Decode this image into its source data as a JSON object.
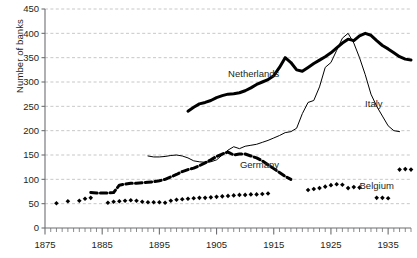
{
  "chart_data": {
    "type": "line",
    "title": "",
    "xlabel": "",
    "ylabel": "Number of banks",
    "xlim": [
      1875,
      1939
    ],
    "ylim": [
      0,
      450
    ],
    "ytick_step": 50,
    "xtick_step": 10,
    "yticks": [
      0,
      50,
      100,
      150,
      200,
      250,
      300,
      350,
      400,
      450
    ],
    "xticks": [
      1875,
      1885,
      1895,
      1905,
      1915,
      1925,
      1935
    ],
    "grid": "horizontal-dashed",
    "legend_position": "inline-annotations",
    "minor_xticks": "every 1 year",
    "series": [
      {
        "name": "Netherlands",
        "style": "thick-solid",
        "color": "#000000",
        "label_x": 1911.5,
        "label_y": 318,
        "points": [
          [
            1900,
            240
          ],
          [
            1901,
            248
          ],
          [
            1902,
            255
          ],
          [
            1903,
            258
          ],
          [
            1904,
            262
          ],
          [
            1905,
            268
          ],
          [
            1906,
            272
          ],
          [
            1907,
            275
          ],
          [
            1908,
            276
          ],
          [
            1909,
            278
          ],
          [
            1910,
            282
          ],
          [
            1911,
            288
          ],
          [
            1912,
            295
          ],
          [
            1913,
            300
          ],
          [
            1914,
            305
          ],
          [
            1915,
            313
          ],
          [
            1916,
            330
          ],
          [
            1917,
            350
          ],
          [
            1918,
            340
          ],
          [
            1919,
            325
          ],
          [
            1920,
            322
          ],
          [
            1921,
            330
          ],
          [
            1922,
            338
          ],
          [
            1923,
            345
          ],
          [
            1924,
            352
          ],
          [
            1925,
            360
          ],
          [
            1926,
            370
          ],
          [
            1927,
            380
          ],
          [
            1928,
            388
          ],
          [
            1929,
            385
          ],
          [
            1930,
            395
          ],
          [
            1931,
            400
          ],
          [
            1932,
            396
          ],
          [
            1933,
            385
          ],
          [
            1934,
            375
          ],
          [
            1935,
            368
          ],
          [
            1936,
            360
          ],
          [
            1937,
            352
          ],
          [
            1938,
            347
          ],
          [
            1939,
            345
          ]
        ]
      },
      {
        "name": "Italy",
        "style": "thin-solid",
        "color": "#000000",
        "label_x": 1932.5,
        "label_y": 255,
        "points": [
          [
            1893,
            148
          ],
          [
            1894,
            146
          ],
          [
            1895,
            146
          ],
          [
            1896,
            147
          ],
          [
            1897,
            149
          ],
          [
            1898,
            150
          ],
          [
            1899,
            148
          ],
          [
            1900,
            144
          ],
          [
            1901,
            138
          ],
          [
            1902,
            136
          ],
          [
            1903,
            135
          ],
          [
            1904,
            136
          ],
          [
            1905,
            140
          ],
          [
            1906,
            150
          ],
          [
            1907,
            160
          ],
          [
            1908,
            167
          ],
          [
            1909,
            163
          ],
          [
            1910,
            168
          ],
          [
            1911,
            170
          ],
          [
            1912,
            172
          ],
          [
            1913,
            176
          ],
          [
            1914,
            180
          ],
          [
            1915,
            185
          ],
          [
            1916,
            190
          ],
          [
            1917,
            196
          ],
          [
            1918,
            198
          ],
          [
            1919,
            205
          ],
          [
            1920,
            235
          ],
          [
            1921,
            258
          ],
          [
            1922,
            262
          ],
          [
            1923,
            290
          ],
          [
            1924,
            330
          ],
          [
            1925,
            340
          ],
          [
            1926,
            365
          ],
          [
            1927,
            390
          ],
          [
            1928,
            400
          ],
          [
            1929,
            380
          ],
          [
            1930,
            350
          ],
          [
            1931,
            315
          ],
          [
            1932,
            275
          ],
          [
            1933,
            250
          ],
          [
            1934,
            230
          ],
          [
            1935,
            210
          ],
          [
            1936,
            200
          ],
          [
            1937,
            198
          ]
        ]
      },
      {
        "name": "Germany",
        "style": "thick-dashed",
        "color": "#000000",
        "label_x": 1912.5,
        "label_y": 130,
        "points": [
          [
            1883,
            73
          ],
          [
            1884,
            72
          ],
          [
            1885,
            72
          ],
          [
            1886,
            72
          ],
          [
            1887,
            73
          ],
          [
            1888,
            88
          ],
          [
            1889,
            90
          ],
          [
            1890,
            92
          ],
          [
            1891,
            92
          ],
          [
            1892,
            93
          ],
          [
            1893,
            94
          ],
          [
            1894,
            95
          ],
          [
            1895,
            97
          ],
          [
            1896,
            100
          ],
          [
            1897,
            105
          ],
          [
            1898,
            110
          ],
          [
            1899,
            116
          ],
          [
            1900,
            120
          ],
          [
            1901,
            123
          ],
          [
            1902,
            128
          ],
          [
            1903,
            134
          ],
          [
            1904,
            140
          ],
          [
            1905,
            147
          ],
          [
            1906,
            152
          ],
          [
            1907,
            156
          ],
          [
            1908,
            150
          ],
          [
            1909,
            152
          ],
          [
            1910,
            152
          ],
          [
            1911,
            148
          ],
          [
            1912,
            144
          ],
          [
            1913,
            138
          ],
          [
            1914,
            130
          ],
          [
            1915,
            122
          ],
          [
            1916,
            114
          ],
          [
            1917,
            106
          ],
          [
            1918,
            100
          ]
        ],
        "gap_note": "series has breaks; early segment 1883-1887 at ~72"
      },
      {
        "name": "Belgium",
        "style": "diamond-markers",
        "color": "#000000",
        "label_x": 1933.0,
        "label_y": 88,
        "points": [
          [
            1877,
            51
          ],
          [
            1879,
            55
          ],
          [
            1881,
            56
          ],
          [
            1882,
            60
          ],
          [
            1883,
            62
          ],
          [
            1886,
            52
          ],
          [
            1887,
            54
          ],
          [
            1888,
            55
          ],
          [
            1889,
            56
          ],
          [
            1890,
            57
          ],
          [
            1891,
            56
          ],
          [
            1892,
            54
          ],
          [
            1893,
            53
          ],
          [
            1894,
            53
          ],
          [
            1895,
            53
          ],
          [
            1896,
            52
          ],
          [
            1897,
            56
          ],
          [
            1898,
            58
          ],
          [
            1899,
            59
          ],
          [
            1900,
            60
          ],
          [
            1901,
            61
          ],
          [
            1902,
            62
          ],
          [
            1903,
            62
          ],
          [
            1904,
            63
          ],
          [
            1905,
            64
          ],
          [
            1906,
            65
          ],
          [
            1907,
            66
          ],
          [
            1908,
            67
          ],
          [
            1909,
            68
          ],
          [
            1910,
            68
          ],
          [
            1911,
            69
          ],
          [
            1912,
            69
          ],
          [
            1913,
            70
          ],
          [
            1914,
            71
          ],
          [
            1921,
            78
          ],
          [
            1922,
            80
          ],
          [
            1923,
            82
          ],
          [
            1924,
            85
          ],
          [
            1925,
            88
          ],
          [
            1926,
            90
          ],
          [
            1927,
            89
          ],
          [
            1928,
            82
          ],
          [
            1929,
            84
          ],
          [
            1930,
            83
          ],
          [
            1933,
            62
          ],
          [
            1934,
            62
          ],
          [
            1935,
            61
          ],
          [
            1937,
            120
          ],
          [
            1938,
            121
          ],
          [
            1939,
            120
          ]
        ]
      }
    ]
  },
  "axis": {
    "y_title": "Number of banks"
  }
}
